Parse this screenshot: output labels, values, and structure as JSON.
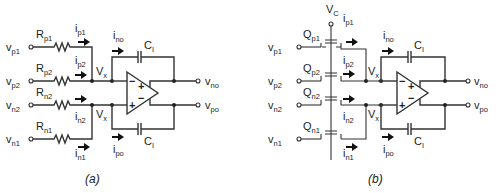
{
  "figure": {
    "panels": [
      {
        "id": "a",
        "caption": "(a)",
        "type": "resistor-input differential integrator",
        "inputs": [
          {
            "node": "v",
            "node_sub": "p1",
            "element": "R",
            "element_sub": "p1",
            "current": "i",
            "current_sub": "p1"
          },
          {
            "node": "v",
            "node_sub": "p2",
            "element": "R",
            "element_sub": "p2",
            "current": "i",
            "current_sub": "p2"
          },
          {
            "node": "v",
            "node_sub": "n2",
            "element": "R",
            "element_sub": "n2",
            "current": "i",
            "current_sub": "n2"
          },
          {
            "node": "v",
            "node_sub": "n1",
            "element": "R",
            "element_sub": "n1",
            "current": "i",
            "current_sub": "n1"
          }
        ],
        "summing_node": {
          "label": "V",
          "sub": "x"
        },
        "feedback_currents": [
          {
            "label": "i",
            "sub": "no"
          },
          {
            "label": "i",
            "sub": "po"
          }
        ],
        "capacitor": {
          "label": "C",
          "sub": "I"
        },
        "outputs": [
          {
            "label": "v",
            "sub": "no"
          },
          {
            "label": "v",
            "sub": "po"
          }
        ],
        "opamp_signs": {
          "in_top": "−",
          "in_bottom": "+",
          "out_top": "+",
          "out_bottom": "−"
        }
      },
      {
        "id": "b",
        "caption": "(b)",
        "type": "MOSFET-input differential integrator",
        "supply": {
          "label": "V",
          "sub": "C"
        },
        "inputs": [
          {
            "node": "v",
            "node_sub": "p1",
            "element": "Q",
            "element_sub": "p1",
            "current": "i",
            "current_sub": "p1"
          },
          {
            "node": "v",
            "node_sub": "p2",
            "element": "Q",
            "element_sub": "p2",
            "current": "i",
            "current_sub": "p2"
          },
          {
            "node": "v",
            "node_sub": "n2",
            "element": "Q",
            "element_sub": "n2",
            "current": "i",
            "current_sub": "n2"
          },
          {
            "node": "v",
            "node_sub": "n1",
            "element": "Q",
            "element_sub": "n1",
            "current": "i",
            "current_sub": "n1"
          }
        ],
        "summing_node": {
          "label": "V",
          "sub": "x"
        },
        "feedback_currents": [
          {
            "label": "i",
            "sub": "no"
          },
          {
            "label": "i",
            "sub": "po"
          }
        ],
        "capacitor": {
          "label": "C",
          "sub": "I"
        },
        "outputs": [
          {
            "label": "v",
            "sub": "no"
          },
          {
            "label": "v",
            "sub": "po"
          }
        ],
        "opamp_signs": {
          "in_top": "−",
          "in_bottom": "+",
          "out_top": "+",
          "out_bottom": "−"
        }
      }
    ],
    "colors": {
      "stroke": "#333333",
      "text": "#222222",
      "background": "#ffffff"
    }
  }
}
